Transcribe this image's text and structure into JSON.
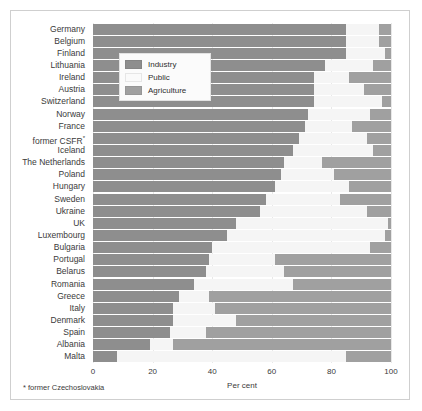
{
  "chart_data": {
    "type": "bar",
    "orientation": "horizontal",
    "stacked": true,
    "title": "",
    "xlabel": "Per cent",
    "ylabel": "",
    "xlim": [
      0,
      100
    ],
    "xticks": [
      0,
      20,
      40,
      60,
      80,
      100
    ],
    "grid": true,
    "legend_position": "upper-left-inset",
    "footnote": "* former Czechoslovakia",
    "categories": [
      "Germany",
      "Belgium",
      "Finland",
      "Lithuania",
      "Ireland",
      "Austria",
      "Switzerland",
      "Norway",
      "France",
      "former CSFR*",
      "Iceland",
      "The Netherlands",
      "Poland",
      "Hungary",
      "Sweden",
      "Ukraine",
      "UK",
      "Luxembourg",
      "Bulgaria",
      "Portugal",
      "Belarus",
      "Romania",
      "Greece",
      "Italy",
      "Denmark",
      "Spain",
      "Albania",
      "Malta"
    ],
    "series": [
      {
        "name": "Industry",
        "color": "#8e8e8e",
        "values": [
          85,
          85,
          85,
          78,
          74,
          74,
          74,
          72,
          71,
          69,
          67,
          64,
          63,
          61,
          58,
          56,
          48,
          45,
          40,
          39,
          38,
          34,
          29,
          27,
          27,
          26,
          19,
          8
        ]
      },
      {
        "name": "Public",
        "color": "#f5f5f5",
        "values": [
          11,
          11,
          13,
          16,
          12,
          17,
          23,
          21,
          16,
          23,
          27,
          13,
          18,
          25,
          25,
          36,
          51,
          53,
          53,
          22,
          26,
          33,
          10,
          14,
          21,
          12,
          8,
          77
        ]
      },
      {
        "name": "Agriculture",
        "color": "#a0a0a0",
        "values": [
          4,
          4,
          2,
          6,
          14,
          9,
          3,
          7,
          13,
          8,
          6,
          23,
          19,
          14,
          17,
          8,
          1,
          2,
          7,
          39,
          36,
          33,
          61,
          59,
          52,
          62,
          73,
          15
        ]
      }
    ]
  },
  "legend": {
    "items": [
      {
        "label": "Industry",
        "swatch": "industry"
      },
      {
        "label": "Public",
        "swatch": "public"
      },
      {
        "label": "Agriculture",
        "swatch": "agriculture"
      }
    ]
  }
}
